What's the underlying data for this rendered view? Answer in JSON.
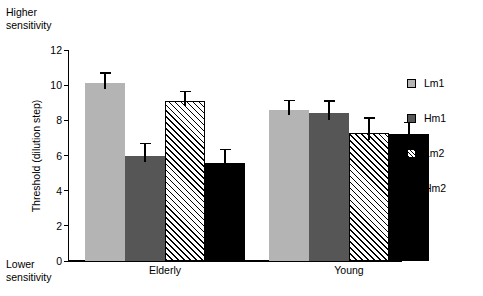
{
  "annotations": {
    "higher_sensitivity": "Higher\nsensitivity",
    "lower_sensitivity": "Lower\nsensitivity"
  },
  "chart_data": {
    "type": "bar",
    "title": "",
    "xlabel": "",
    "ylabel": "Threshold (dilution step)",
    "ylim": [
      0,
      12
    ],
    "yticks": [
      0,
      2,
      4,
      6,
      8,
      10,
      12
    ],
    "ytick_labels": [
      "0",
      "2",
      "4",
      "6",
      "8",
      "10",
      "12"
    ],
    "grid": false,
    "legend_position": "right",
    "categories": [
      "Elderly",
      "Young"
    ],
    "series": [
      {
        "name": "Lm1",
        "fill": "fill-light",
        "color": "#b4b4b4",
        "values": [
          10.1,
          8.6
        ],
        "errors": [
          0.55,
          0.5
        ]
      },
      {
        "name": "Hm1",
        "fill": "fill-dark",
        "color": "#565656",
        "values": [
          6.0,
          8.4
        ],
        "errors": [
          0.65,
          0.65
        ]
      },
      {
        "name": "Lm2",
        "fill": "fill-hatch",
        "color": "#ffffff",
        "values": [
          9.1,
          7.3
        ],
        "errors": [
          0.5,
          0.8
        ]
      },
      {
        "name": "Hm2",
        "fill": "fill-black",
        "color": "#000000",
        "values": [
          5.6,
          7.2
        ],
        "errors": [
          0.7,
          0.65
        ]
      }
    ]
  }
}
